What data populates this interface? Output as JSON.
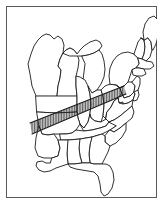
{
  "figure": {
    "title": "Map of the eastern United States",
    "description": "Outline map of the eastern United States with state boundaries; a diagonal band across Tennessee, northern Alabama, northern Mississippi and western Kentucky is filled with vertical hatching.",
    "background_color": "#ffffff",
    "frame_color": "#555a5e",
    "outline_color": "#1b1b1b",
    "hatch_color": "#222222",
    "width": 163,
    "height": 204
  },
  "map": {
    "region_name": "Eastern United States",
    "projection_note": "simplified outline",
    "highlight": {
      "name": "hatched-band",
      "pattern": "vertical-hatching",
      "states_covered": "Tennessee, northern Alabama, northern Mississippi, western Kentucky",
      "line_spacing_px": 1.6,
      "line_count": 52
    },
    "states": [
      {
        "id": "minnesota",
        "label": "Minnesota"
      },
      {
        "id": "wisconsin",
        "label": "Wisconsin"
      },
      {
        "id": "michigan-upper",
        "label": "Michigan Upper Peninsula"
      },
      {
        "id": "michigan-lower",
        "label": "Michigan Lower Peninsula"
      },
      {
        "id": "iowa",
        "label": "Iowa"
      },
      {
        "id": "illinois",
        "label": "Illinois"
      },
      {
        "id": "indiana",
        "label": "Indiana"
      },
      {
        "id": "ohio",
        "label": "Ohio"
      },
      {
        "id": "missouri",
        "label": "Missouri"
      },
      {
        "id": "kentucky",
        "label": "Kentucky"
      },
      {
        "id": "west-virginia",
        "label": "West Virginia"
      },
      {
        "id": "virginia",
        "label": "Virginia"
      },
      {
        "id": "maryland",
        "label": "Maryland"
      },
      {
        "id": "delaware",
        "label": "Delaware"
      },
      {
        "id": "new-jersey",
        "label": "New Jersey"
      },
      {
        "id": "pennsylvania",
        "label": "Pennsylvania"
      },
      {
        "id": "new-york",
        "label": "New York"
      },
      {
        "id": "vermont",
        "label": "Vermont"
      },
      {
        "id": "new-hampshire",
        "label": "New Hampshire"
      },
      {
        "id": "maine",
        "label": "Maine"
      },
      {
        "id": "massachusetts",
        "label": "Massachusetts"
      },
      {
        "id": "connecticut-rhode-island",
        "label": "Connecticut and Rhode Island"
      },
      {
        "id": "tennessee",
        "label": "Tennessee"
      },
      {
        "id": "north-carolina",
        "label": "North Carolina"
      },
      {
        "id": "south-carolina",
        "label": "South Carolina"
      },
      {
        "id": "georgia",
        "label": "Georgia"
      },
      {
        "id": "florida",
        "label": "Florida"
      },
      {
        "id": "alabama",
        "label": "Alabama"
      },
      {
        "id": "mississippi",
        "label": "Mississippi"
      },
      {
        "id": "louisiana",
        "label": "Louisiana"
      },
      {
        "id": "arkansas",
        "label": "Arkansas"
      }
    ]
  }
}
